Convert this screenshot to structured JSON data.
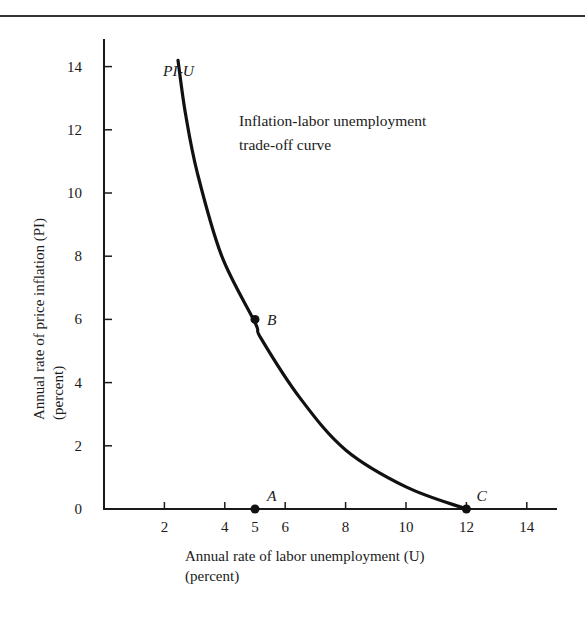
{
  "chart_data": {
    "type": "line",
    "title": "",
    "annotation": [
      "Inflation-labor unemployment",
      "trade-off curve"
    ],
    "curve_label": "PI-U",
    "xlabel": [
      "Annual rate of labor unemployment (U)",
      "(percent)"
    ],
    "ylabel": [
      "Annual rate of price inflation (PI)",
      "(percent)"
    ],
    "xlim": [
      0,
      15
    ],
    "ylim": [
      0,
      14.8
    ],
    "x_ticks": [
      2,
      4,
      5,
      6,
      8,
      10,
      12,
      14
    ],
    "y_ticks": [
      0,
      2,
      4,
      6,
      8,
      10,
      12,
      14
    ],
    "grid": false,
    "legend": null,
    "series": [
      {
        "name": "PI-U",
        "x": [
          2.45,
          2.7,
          3.1,
          3.9,
          5.0,
          5.2,
          6.5,
          8.0,
          10.0,
          11.9
        ],
        "y": [
          14.2,
          12.5,
          10.6,
          8.0,
          5.9,
          5.4,
          3.5,
          1.87,
          0.7,
          0.03
        ]
      }
    ],
    "points": [
      {
        "label": "A",
        "x": 5,
        "y": 0
      },
      {
        "label": "B",
        "x": 5,
        "y": 6
      },
      {
        "label": "C",
        "x": 12,
        "y": 0
      }
    ]
  },
  "labels": {
    "curve": "PI-U",
    "annotation_line1": "Inflation-labor unemployment",
    "annotation_line2": "trade-off curve",
    "xlabel_line1": "Annual rate of labor unemployment (U)",
    "xlabel_line2": "(percent)",
    "ylabel_line1": "Annual rate of price inflation (PI)",
    "ylabel_line2": "(percent)",
    "point_a": "A",
    "point_b": "B",
    "point_c": "C"
  }
}
